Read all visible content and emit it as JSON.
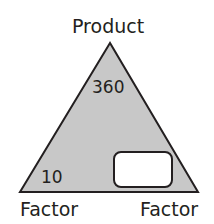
{
  "diagram": {
    "type": "fact-family-triangle",
    "top_label": "Product",
    "bottom_left_label": "Factor",
    "bottom_right_label": "Factor",
    "product_value": "360",
    "left_factor_value": "10",
    "right_factor_value": "",
    "colors": {
      "triangle_fill": "#c8c8c8",
      "stroke": "#231f20",
      "answer_box_fill": "#ffffff"
    }
  }
}
